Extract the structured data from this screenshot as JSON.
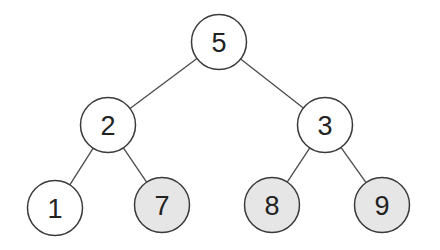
{
  "diagram": {
    "type": "binary-tree",
    "colors": {
      "background": "#ffffff",
      "default_fill": "#ffffff",
      "highlight_fill": "#e6e6e6",
      "stroke": "#3a3a3a",
      "edge": "#4a4a4a",
      "text": "#222222"
    },
    "node_radius": 27.5,
    "nodes": [
      {
        "id": "n5",
        "label": "5",
        "x": 219,
        "y": 42,
        "highlighted": false
      },
      {
        "id": "n2",
        "label": "2",
        "x": 108,
        "y": 125,
        "highlighted": false
      },
      {
        "id": "n3",
        "label": "3",
        "x": 325,
        "y": 125,
        "highlighted": false
      },
      {
        "id": "n1",
        "label": "1",
        "x": 55,
        "y": 208,
        "highlighted": false
      },
      {
        "id": "n7",
        "label": "7",
        "x": 162,
        "y": 205,
        "highlighted": true
      },
      {
        "id": "n8",
        "label": "8",
        "x": 272,
        "y": 205,
        "highlighted": true
      },
      {
        "id": "n9",
        "label": "9",
        "x": 382,
        "y": 205,
        "highlighted": true
      }
    ],
    "edges": [
      {
        "from": "n5",
        "to": "n2"
      },
      {
        "from": "n5",
        "to": "n3"
      },
      {
        "from": "n2",
        "to": "n1"
      },
      {
        "from": "n2",
        "to": "n7"
      },
      {
        "from": "n3",
        "to": "n8"
      },
      {
        "from": "n3",
        "to": "n9"
      }
    ]
  }
}
